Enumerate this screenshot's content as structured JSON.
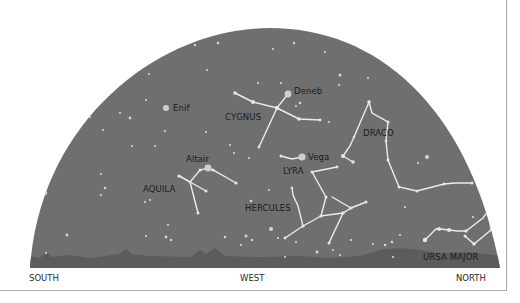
{
  "colors": {
    "sky": "#6f6f6f",
    "horizon": "#5e5e5e",
    "line": "#eeeeee",
    "star": "#dddddd",
    "text": "#1a1a1a"
  },
  "directions": {
    "south": "SOUTH",
    "west": "WEST",
    "north": "NORTH"
  },
  "constellations": {
    "cygnus": "CYGNUS",
    "draco": "DRACO",
    "aquila": "AQUILA",
    "lyra": "LYRA",
    "hercules": "HERCULES",
    "ursa_major": "URSA MAJOR"
  },
  "stars": {
    "deneb": "Deneb",
    "enif": "Enif",
    "altair": "Altair",
    "vega": "Vega"
  }
}
